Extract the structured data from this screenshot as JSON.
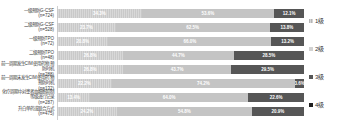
{
  "chart_data": {
    "type": "bar",
    "orientation": "horizontal-stacked",
    "unit": "%",
    "xlim": [
      0,
      100
    ],
    "grid": false,
    "legend_position": "right",
    "legend": [
      {
        "label": "1级",
        "color": "#c9c9c9",
        "hatched": true
      },
      {
        "label": "2级",
        "color": "#d2d2d2",
        "hatched": false
      },
      {
        "label": "3级",
        "color": "#565656",
        "hatched": false
      },
      {
        "label": "4级",
        "color": "#1f1f1f",
        "hatched": false
      }
    ],
    "rows": [
      {
        "label": "一级预防G-CSF",
        "n_label": "(n=724)",
        "values": [
          34.3,
          53.6,
          12.1
        ]
      },
      {
        "label": "二级预防G-CSF",
        "n_label": "(n=528)",
        "values": [
          23.7,
          62.5,
          13.8
        ]
      },
      {
        "label": "一级预防TPO",
        "n_label": "(n=72)",
        "values": [
          20.8,
          66.0,
          13.2
        ]
      },
      {
        "label": "二级预防TPO",
        "n_label": "(n=48)",
        "values": [
          26.8,
          44.7,
          28.5
        ]
      },
      {
        "label": "前一周期发生CIM使用药物 预防时机",
        "n_label": "(n=288)",
        "values": [
          26.8,
          43.7,
          29.5
        ]
      },
      {
        "label": "前一周期未发生CIM使用药 物预防时机",
        "n_label": "(n=132)",
        "values": [
          22.2,
          74.2,
          3.6
        ]
      },
      {
        "label": "化疗周期中对患者血细胞抑制 等级进行记录",
        "n_label": "(n=287)",
        "values": [
          13.4,
          64.0,
          22.6
        ]
      },
      {
        "label": "升白单药或联合方式",
        "n_label": "(n=475)",
        "values": [
          24.2,
          54.8,
          20.9
        ]
      }
    ]
  }
}
